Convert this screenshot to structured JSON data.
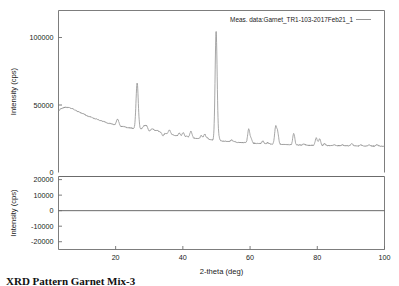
{
  "figure": {
    "background_color": "#ffffff",
    "curve_color": "#8a8a8a",
    "axis_color": "#6e6e6e"
  },
  "legend": {
    "entry_label": "Meas. data:Garnet_TR1-103-2017Feb21_1"
  },
  "caption": {
    "text": "XRD Pattern  Garnet Mix-3"
  },
  "top_panel": {
    "ylabel": "Intensity (cps)",
    "yticks": [
      50000,
      100000
    ],
    "ytick_labels": [
      "50000",
      "100000"
    ],
    "extra_label": "0"
  },
  "bottom_panel": {
    "ylabel": "Intensity (cps)",
    "yticks": [
      20000,
      10000,
      0,
      -10000,
      -20000
    ],
    "ytick_labels": [
      "20000",
      "10000",
      "0",
      "-10000",
      "-20000"
    ]
  },
  "xaxis": {
    "label": "2-theta (deg)",
    "ticks": [
      20,
      40,
      60,
      80,
      100
    ],
    "tick_labels": [
      "20",
      "40",
      "60",
      "80",
      "100"
    ]
  },
  "chart_data": {
    "type": "line",
    "title": "",
    "subtitle": "",
    "xlabel": "2-theta (deg)",
    "ylabel": "Intensity (cps)",
    "xlim": [
      3,
      100
    ],
    "ylim": [
      0,
      120000
    ],
    "residual_ylim": [
      -25000,
      22000
    ],
    "grid": false,
    "legend_position": "top-right",
    "series": [
      {
        "name": "Meas. data:Garnet_TR1-103-2017Feb21_1",
        "color": "#8a8a8a",
        "background_x": [
          3,
          4,
          5,
          6,
          7,
          8,
          9,
          10,
          12,
          14,
          16,
          18,
          20,
          22,
          24,
          26,
          28,
          30,
          32,
          34,
          36,
          38,
          40,
          42,
          44,
          46,
          48,
          50,
          52,
          55,
          58,
          61,
          64,
          67,
          70,
          74,
          78,
          82,
          86,
          90,
          94,
          97,
          100
        ],
        "background_y": [
          45800,
          47600,
          48300,
          48200,
          47400,
          46200,
          45000,
          43800,
          41600,
          39700,
          38100,
          36500,
          35300,
          34100,
          33100,
          32300,
          33200,
          33700,
          31200,
          29500,
          28300,
          27300,
          26500,
          25900,
          25300,
          24800,
          24200,
          23700,
          23200,
          22600,
          22100,
          21700,
          21300,
          21000,
          20700,
          20400,
          20200,
          20000,
          19800,
          19700,
          19600,
          19550,
          19500
        ],
        "peaks": [
          {
            "two_theta": 20.6,
            "height": 39500,
            "width": 0.35
          },
          {
            "two_theta": 26.4,
            "height": 66500,
            "width": 0.33
          },
          {
            "two_theta": 27.6,
            "height": 31900,
            "width": 0.3
          },
          {
            "two_theta": 29.0,
            "height": 35100,
            "width": 0.75
          },
          {
            "two_theta": 30.0,
            "height": 30100,
            "width": 0.4
          },
          {
            "two_theta": 34.1,
            "height": 27300,
            "width": 0.3
          },
          {
            "two_theta": 36.0,
            "height": 31600,
            "width": 0.32
          },
          {
            "two_theta": 39.0,
            "height": 29100,
            "width": 0.3
          },
          {
            "two_theta": 40.1,
            "height": 29600,
            "width": 0.3
          },
          {
            "two_theta": 41.2,
            "height": 26900,
            "width": 0.28
          },
          {
            "two_theta": 42.4,
            "height": 30500,
            "width": 0.32
          },
          {
            "two_theta": 45.5,
            "height": 27200,
            "width": 0.3
          },
          {
            "two_theta": 46.5,
            "height": 28300,
            "width": 0.3
          },
          {
            "two_theta": 47.3,
            "height": 25700,
            "width": 0.28
          },
          {
            "two_theta": 49.9,
            "height": 104500,
            "width": 0.3
          },
          {
            "two_theta": 50.6,
            "height": 26600,
            "width": 0.3
          },
          {
            "two_theta": 54.5,
            "height": 24100,
            "width": 0.32
          },
          {
            "two_theta": 55.3,
            "height": 23000,
            "width": 0.28
          },
          {
            "two_theta": 59.6,
            "height": 32200,
            "width": 0.3
          },
          {
            "two_theta": 60.3,
            "height": 25000,
            "width": 0.28
          },
          {
            "two_theta": 63.8,
            "height": 23200,
            "width": 0.3
          },
          {
            "two_theta": 65.3,
            "height": 22100,
            "width": 0.3
          },
          {
            "two_theta": 67.6,
            "height": 33200,
            "width": 0.3
          },
          {
            "two_theta": 68.2,
            "height": 29500,
            "width": 0.3
          },
          {
            "two_theta": 73.0,
            "height": 29000,
            "width": 0.3
          },
          {
            "two_theta": 76.0,
            "height": 21200,
            "width": 0.3
          },
          {
            "two_theta": 79.7,
            "height": 25600,
            "width": 0.32
          },
          {
            "two_theta": 80.7,
            "height": 24800,
            "width": 0.3
          },
          {
            "two_theta": 82.2,
            "height": 21300,
            "width": 0.3
          },
          {
            "two_theta": 85.0,
            "height": 20700,
            "width": 0.3
          },
          {
            "two_theta": 87.5,
            "height": 20500,
            "width": 0.3
          },
          {
            "two_theta": 90.3,
            "height": 21300,
            "width": 0.3
          },
          {
            "two_theta": 93.0,
            "height": 20400,
            "width": 0.3
          },
          {
            "two_theta": 95.4,
            "height": 20500,
            "width": 0.3
          },
          {
            "two_theta": 97.8,
            "height": 20600,
            "width": 0.3
          }
        ]
      }
    ],
    "residual_series": {
      "name": "residual",
      "values_flat": 0
    }
  }
}
